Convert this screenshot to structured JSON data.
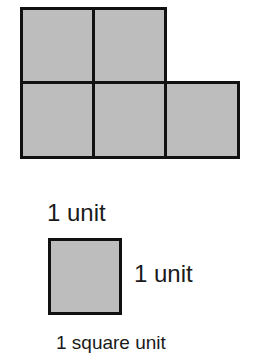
{
  "figure": {
    "shape": {
      "description": "Composite figure of 5 unit squares: 2 on top row, 3 on bottom row",
      "fill_color": "#bdbdbd",
      "border_color": "#111111",
      "rows": [
        {
          "row": 1,
          "squares": 2
        },
        {
          "row": 2,
          "squares": 3
        }
      ],
      "total_squares": 5
    },
    "legend": {
      "top_label": "1 unit",
      "side_label": "1 unit",
      "caption": "1 square unit"
    }
  }
}
